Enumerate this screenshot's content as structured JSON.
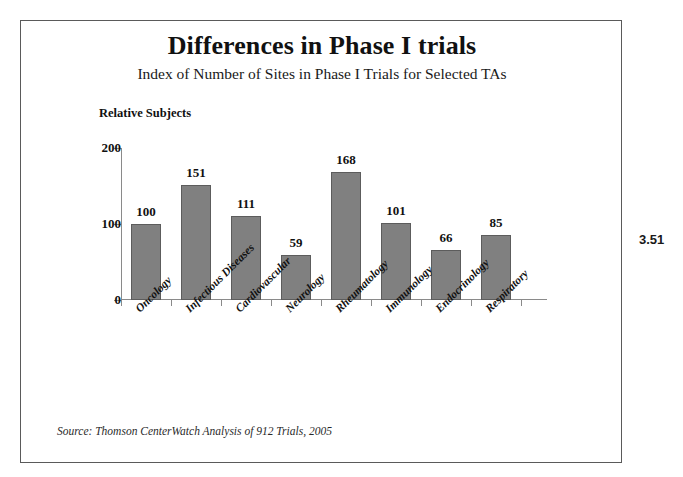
{
  "page_marker": "3.51",
  "source_note": "Source: Thomson CenterWatch Analysis of 912 Trials, 2005",
  "chart_data": {
    "type": "bar",
    "title": "Differences in Phase I trials",
    "subtitle": "Index of Number of Sites in Phase I Trials for Selected TAs",
    "xlabel": "",
    "ylabel": "Relative Subjects",
    "ylim": [
      0,
      200
    ],
    "yticks": [
      0,
      100,
      200
    ],
    "ytick_labels": [
      "0",
      "100",
      "200"
    ],
    "grid": false,
    "legend": false,
    "bar_color": "#808080",
    "bar_edge_color": "#5c5c5c",
    "value_labels": true,
    "category_label_rotation": -45,
    "categories": [
      "Oncology",
      "Infectious Diseases",
      "Cardiovascular",
      "Neurology",
      "Rheumatology",
      "Immunology",
      "Endocrinology",
      "Respiratory"
    ],
    "values": [
      100,
      151,
      111,
      59,
      168,
      101,
      66,
      85
    ]
  }
}
